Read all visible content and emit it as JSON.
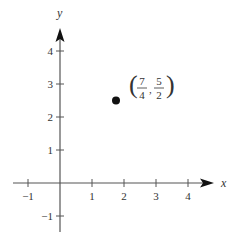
{
  "chart_data": {
    "type": "scatter",
    "title": "",
    "xlabel": "x",
    "ylabel": "y",
    "xlim": [
      -1.5,
      4.8
    ],
    "ylim": [
      -1.5,
      4.8
    ],
    "grid": false,
    "x_ticks": [
      -1,
      1,
      2,
      3,
      4
    ],
    "y_ticks": [
      -1,
      1,
      2,
      3,
      4
    ],
    "x_tick_labels": [
      "−1",
      "1",
      "2",
      "3",
      "4"
    ],
    "y_tick_labels": [
      "−1",
      "1",
      "2",
      "3",
      "4"
    ],
    "points": [
      {
        "x": 1.75,
        "y": 2.5,
        "label": "(7/4, 5/2)"
      }
    ],
    "annotations": [
      {
        "text": "(7/4, 5/2)",
        "x_num": "7",
        "x_den": "4",
        "y_num": "5",
        "y_den": "2"
      }
    ]
  },
  "colors": {
    "axis": "#555555",
    "point": "#111111",
    "text": "#333333"
  }
}
